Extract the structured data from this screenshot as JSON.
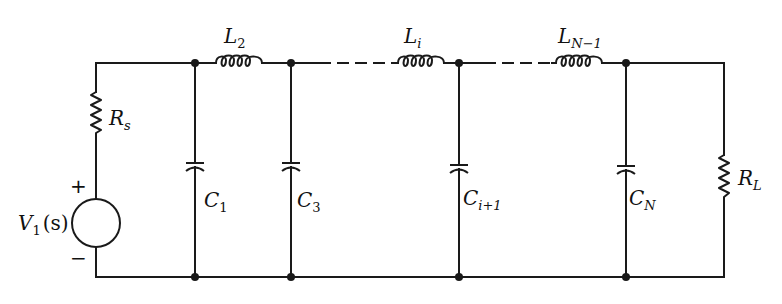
{
  "diagram": {
    "type": "ladder-network-circuit",
    "colors": {
      "ink": "#1a1a1a",
      "background": "#ffffff"
    },
    "source": {
      "label_main": "V",
      "label_sub": "1",
      "label_arg": "(s)",
      "plus": "+",
      "minus": "−"
    },
    "source_resistor": {
      "label_main": "R",
      "label_sub": "s"
    },
    "load_resistor": {
      "label_main": "R",
      "label_sub": "L"
    },
    "inductors": [
      {
        "label_main": "L",
        "label_sub": "2"
      },
      {
        "label_main": "L",
        "label_sub": "i"
      },
      {
        "label_main": "L",
        "label_sub": "N−1"
      }
    ],
    "capacitors": [
      {
        "label_main": "C",
        "label_sub": "1"
      },
      {
        "label_main": "C",
        "label_sub": "3"
      },
      {
        "label_main": "C",
        "label_sub": "i+1"
      },
      {
        "label_main": "C",
        "label_sub": "N"
      }
    ]
  }
}
